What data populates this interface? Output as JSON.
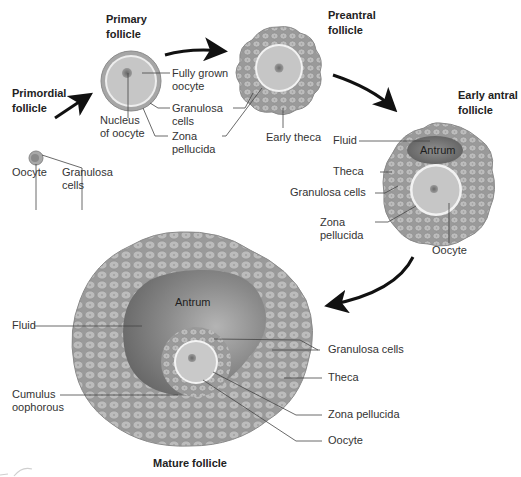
{
  "diagram": {
    "colors": {
      "background": "#ffffff",
      "cell_fill": "#b8b8b8",
      "cell_outline": "#8c8c8c",
      "granulosa_mass": "#9d9d9d",
      "oocyte_fill": "#c9c9c9",
      "zona_ring": "#eeeeee",
      "nucleus": "#7a7a7a",
      "antrum_dark": "#6e6e6e",
      "antrum_light": "#a9a9a9",
      "arrow": "#111111",
      "leader_line": "#444444",
      "text": "#333333"
    },
    "stages": [
      {
        "id": "primordial",
        "title_lines": [
          "Primordial",
          "follicle"
        ],
        "labels": [
          {
            "id": "oocyte",
            "lines": [
              "Oocyte"
            ]
          },
          {
            "id": "granulosa",
            "lines": [
              "Granulosa",
              "cells"
            ]
          }
        ]
      },
      {
        "id": "primary",
        "title_lines": [
          "Primary",
          "follicle"
        ],
        "labels": [
          {
            "id": "fully-grown-oocyte",
            "lines": [
              "Fully grown",
              "oocyte"
            ]
          },
          {
            "id": "granulosa",
            "lines": [
              "Granulosa",
              "cells"
            ]
          },
          {
            "id": "zona",
            "lines": [
              "Zona",
              "pellucida"
            ]
          },
          {
            "id": "nucleus",
            "lines": [
              "Nucleus",
              "of oocyte"
            ]
          }
        ]
      },
      {
        "id": "preantral",
        "title_lines": [
          "Preantral",
          "follicle"
        ],
        "labels": [
          {
            "id": "early-theca",
            "lines": [
              "Early theca"
            ]
          }
        ]
      },
      {
        "id": "early-antral",
        "title_lines": [
          "Early antral",
          "follicle"
        ],
        "inner_label": "Antrum",
        "labels": [
          {
            "id": "fluid",
            "lines": [
              "Fluid"
            ]
          },
          {
            "id": "theca",
            "lines": [
              "Theca"
            ]
          },
          {
            "id": "granulosa",
            "lines": [
              "Granulosa cells"
            ]
          },
          {
            "id": "zona",
            "lines": [
              "Zona",
              "pellucida"
            ]
          },
          {
            "id": "oocyte",
            "lines": [
              "Oocyte"
            ]
          }
        ]
      },
      {
        "id": "mature",
        "title_lines": [
          "Mature follicle"
        ],
        "inner_label": "Antrum",
        "labels": [
          {
            "id": "fluid",
            "lines": [
              "Fluid"
            ]
          },
          {
            "id": "cumulus",
            "lines": [
              "Cumulus",
              "oophorous"
            ]
          },
          {
            "id": "granulosa",
            "lines": [
              "Granulosa cells"
            ]
          },
          {
            "id": "theca",
            "lines": [
              "Theca"
            ]
          },
          {
            "id": "zona",
            "lines": [
              "Zona pellucida"
            ]
          },
          {
            "id": "oocyte",
            "lines": [
              "Oocyte"
            ]
          }
        ]
      }
    ],
    "arrows": [
      {
        "from": "primordial",
        "to": "primary"
      },
      {
        "from": "primary",
        "to": "preantral"
      },
      {
        "from": "preantral",
        "to": "early-antral"
      },
      {
        "from": "early-antral",
        "to": "mature"
      }
    ]
  }
}
